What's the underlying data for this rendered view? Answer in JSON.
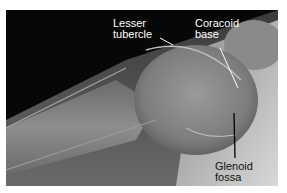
{
  "figure": {
    "labels": [
      {
        "id": "lesser-tubercle",
        "lines": [
          "Lesser",
          "tubercle"
        ]
      },
      {
        "id": "coracoid-base",
        "lines": [
          "Coracoid",
          "base"
        ]
      },
      {
        "id": "glenoid-fossa",
        "lines": [
          "Glenoid",
          "fossa"
        ]
      }
    ]
  }
}
